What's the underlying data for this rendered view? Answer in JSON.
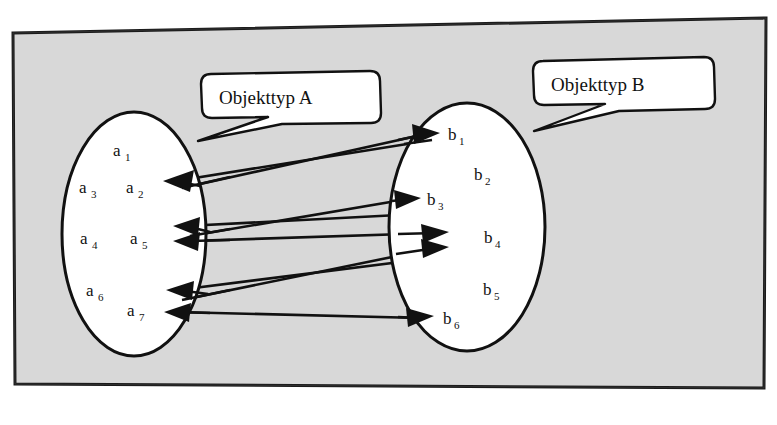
{
  "diagram": {
    "background_color": "#ffffff",
    "frame_fill": "#d9d9d9",
    "frame_stroke": "#1a1a1a",
    "ink_color": "#111111",
    "ellipse_fill": "#ffffff"
  },
  "callouts": [
    {
      "id": "callout-a",
      "label": "Objekttyp A",
      "points_to": "set-a"
    },
    {
      "id": "callout-b",
      "label": "Objekttyp B",
      "points_to": "set-b"
    }
  ],
  "sets": [
    {
      "id": "set-a",
      "name": "Objekttyp A",
      "elements": [
        {
          "id": "a1",
          "label": "a",
          "subscript": "1"
        },
        {
          "id": "a2",
          "label": "a",
          "subscript": "2"
        },
        {
          "id": "a3",
          "label": "a",
          "subscript": "3"
        },
        {
          "id": "a4",
          "label": "a",
          "subscript": "4"
        },
        {
          "id": "a5",
          "label": "a",
          "subscript": "5"
        },
        {
          "id": "a6",
          "label": "a",
          "subscript": "6"
        },
        {
          "id": "a7",
          "label": "a",
          "subscript": "7"
        }
      ]
    },
    {
      "id": "set-b",
      "name": "Objekttyp B",
      "elements": [
        {
          "id": "b1",
          "label": "b",
          "subscript": "1"
        },
        {
          "id": "b2",
          "label": "b",
          "subscript": "2"
        },
        {
          "id": "b3",
          "label": "b",
          "subscript": "3"
        },
        {
          "id": "b4",
          "label": "b",
          "subscript": "4"
        },
        {
          "id": "b5",
          "label": "b",
          "subscript": "5"
        },
        {
          "id": "b6",
          "label": "b",
          "subscript": "6"
        }
      ]
    }
  ],
  "relations": [
    {
      "id": "rel-a2-b1",
      "from": "a2",
      "to": "b1",
      "direction": "a-to-b"
    },
    {
      "id": "rel-b1-a2",
      "from": "b1",
      "to": "a2",
      "direction": "b-to-a"
    },
    {
      "id": "rel-a5-b3",
      "from": "a5",
      "to": "b3",
      "direction": "a-to-b"
    },
    {
      "id": "rel-b4-a5",
      "from": "b4",
      "to": "a5",
      "direction": "b-to-a"
    },
    {
      "id": "rel-a5-b4",
      "from": "a5",
      "to": "b4",
      "direction": "a-to-b"
    },
    {
      "id": "rel-a7-b4",
      "from": "a7",
      "to": "b4",
      "direction": "a-to-b"
    },
    {
      "id": "rel-b4-a7",
      "from": "b4",
      "to": "a7",
      "direction": "b-to-a"
    },
    {
      "id": "rel-b6-a7",
      "from": "b6",
      "to": "a7",
      "direction": "b-to-a"
    }
  ]
}
